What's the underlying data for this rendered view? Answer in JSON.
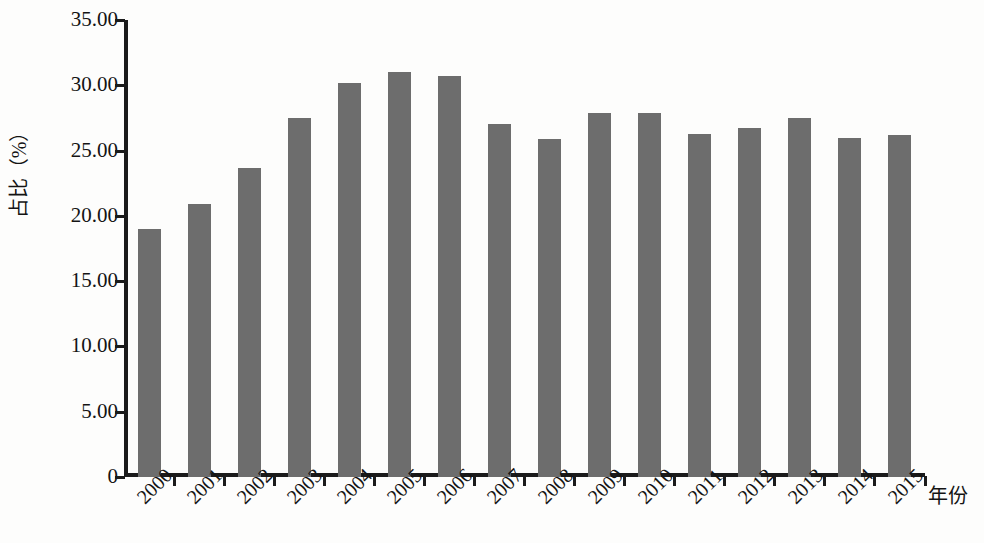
{
  "chart_data": {
    "type": "bar",
    "title": "",
    "xlabel": "年份",
    "ylabel": "占比（%）",
    "categories": [
      "2000",
      "2001",
      "2002",
      "2003",
      "2004",
      "2005",
      "2006",
      "2007",
      "2008",
      "2009",
      "2010",
      "2011",
      "2012",
      "2013",
      "2014",
      "2015"
    ],
    "values": [
      19.0,
      20.9,
      23.7,
      27.5,
      30.2,
      31.0,
      30.7,
      27.0,
      25.9,
      27.9,
      27.9,
      26.3,
      26.7,
      27.5,
      26.0,
      26.2
    ],
    "series": [
      {
        "name": "占比",
        "values": [
          19.0,
          20.9,
          23.7,
          27.5,
          30.2,
          31.0,
          30.7,
          27.0,
          25.9,
          27.9,
          27.9,
          26.3,
          26.7,
          27.5,
          26.0,
          26.2
        ]
      }
    ],
    "ylim": [
      0,
      35
    ],
    "ytick_values": [
      0,
      5,
      10,
      15,
      20,
      25,
      30,
      35
    ],
    "ytick_labels": [
      "0",
      "5.00",
      "10.00",
      "15.00",
      "20.00",
      "25.00",
      "30.00",
      "35.00"
    ],
    "grid": false,
    "legend": false,
    "legend_position": "none",
    "bar_color": "#6d6d6d",
    "axis_color": "#1b1b1b",
    "background_color": "#fdfdfc",
    "xtick_rotation": -45
  }
}
